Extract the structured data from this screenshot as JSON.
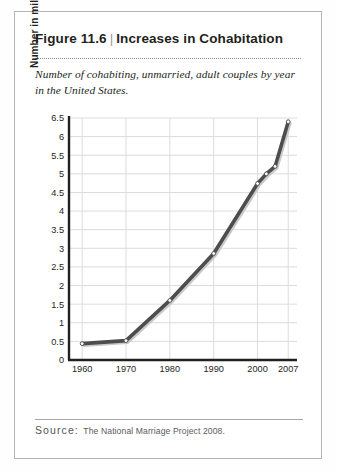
{
  "figure": {
    "label": "Figure 11.6",
    "divider": "|",
    "title": "Increases in Cohabitation",
    "subtitle": "Number of cohabiting, unmarried, adult couples by year in the United States.",
    "source_label": "Source:",
    "source_text": "The National Marriage Project 2008.",
    "border_color": "#b4b4b4"
  },
  "chart_data": {
    "type": "line",
    "title": "Increases in Cohabitation",
    "subtitle": "Number of cohabiting, unmarried, adult couples by year in the United States.",
    "xlabel": "",
    "ylabel": "Number in millions",
    "xlim": [
      1957,
      2009
    ],
    "ylim": [
      0,
      6.5
    ],
    "grid": true,
    "legend": false,
    "line_color": "#4d4d4d",
    "marker_face_color": "#ffffff",
    "marker_edge_color": "#4d4d4d",
    "grid_color": "#dcdcdc",
    "axis_color": "#231f20",
    "xticks": [
      1960,
      1970,
      1980,
      1990,
      2000,
      2007
    ],
    "xtick_labels": [
      "1960",
      "1970",
      "1980",
      "1990",
      "2000",
      "2007"
    ],
    "yticks": [
      0,
      0.5,
      1,
      1.5,
      2,
      2.5,
      3,
      3.5,
      4,
      4.5,
      5,
      5.5,
      6,
      6.5
    ],
    "ytick_labels": [
      "0",
      "0.5",
      "1",
      "1.5",
      "2",
      "2.5",
      "3",
      "3.5",
      "4",
      "4.5",
      "5",
      "5.5",
      "6",
      "6.5"
    ],
    "x": [
      1960,
      1970,
      1980,
      1990,
      2000,
      2002,
      2004,
      2007
    ],
    "values": [
      0.44,
      0.52,
      1.6,
      2.86,
      4.74,
      5.0,
      5.2,
      6.4
    ],
    "series": [
      {
        "name": "Cohabiting unmarried adult couples",
        "x": [
          1960,
          1970,
          1980,
          1990,
          2000,
          2002,
          2004,
          2007
        ],
        "values": [
          0.44,
          0.52,
          1.6,
          2.86,
          4.74,
          5.0,
          5.2,
          6.4
        ]
      }
    ]
  }
}
